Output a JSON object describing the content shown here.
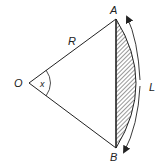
{
  "diagram": {
    "labels": {
      "center": "O",
      "point_a": "A",
      "point_b": "B",
      "radius": "R",
      "angle": "x",
      "arc_length": "L"
    },
    "colors": {
      "stroke": "#222222",
      "hatch": "#333333",
      "background": "#ffffff"
    }
  }
}
